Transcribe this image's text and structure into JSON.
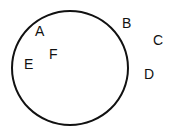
{
  "diagram": {
    "type": "circle-with-labeled-points",
    "canvas": {
      "width": 174,
      "height": 133,
      "background": "#ffffff"
    },
    "circle": {
      "cx": 70,
      "cy": 67.5,
      "rx": 59,
      "ry": 58,
      "stroke": "#111111",
      "stroke_width": 2
    },
    "points": [
      {
        "label": "A",
        "x": 35,
        "y": 24,
        "region": "inside"
      },
      {
        "label": "B",
        "x": 122,
        "y": 16,
        "region": "outside"
      },
      {
        "label": "C",
        "x": 153,
        "y": 33,
        "region": "outside"
      },
      {
        "label": "D",
        "x": 144,
        "y": 67,
        "region": "outside"
      },
      {
        "label": "E",
        "x": 24,
        "y": 57,
        "region": "inside"
      },
      {
        "label": "F",
        "x": 49,
        "y": 47,
        "region": "inside"
      }
    ]
  }
}
